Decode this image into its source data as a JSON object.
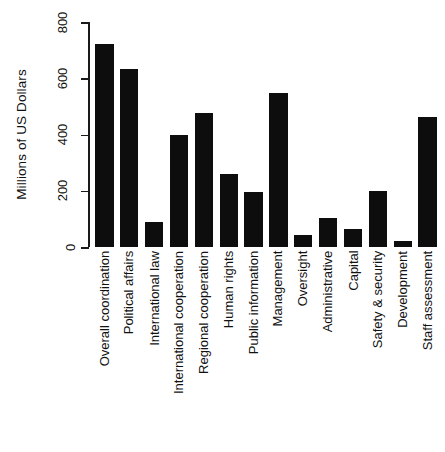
{
  "chart_data": {
    "type": "bar",
    "title": "",
    "subtitle": "",
    "xlabel": "",
    "ylabel": "Millions of US Dollars",
    "ylim": [
      0,
      800
    ],
    "yticks": [
      0,
      200,
      400,
      600,
      800
    ],
    "ytick_labels": [
      "0",
      "200",
      "400",
      "600",
      "800"
    ],
    "grid": false,
    "legend": false,
    "legend_position": "none",
    "bar_color": "#0d0d0d",
    "axis_color": "#1a1a1a",
    "background_color": "#ffffff",
    "categories": [
      "Overall coordination",
      "Political affairs",
      "International law",
      "International cooperation",
      "Regional cooperation",
      "Human rights",
      "Public information",
      "Management",
      "Oversight",
      "Administrative",
      "Capital",
      "Safety & security",
      "Development",
      "Staff assessment"
    ],
    "values": [
      722,
      633,
      89,
      398,
      476,
      260,
      196,
      548,
      43,
      103,
      64,
      199,
      21,
      462
    ]
  }
}
